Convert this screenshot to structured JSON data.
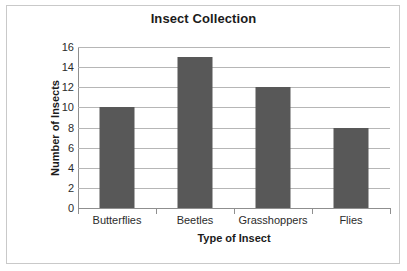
{
  "chart_data": {
    "type": "bar",
    "title": "Insect Collection",
    "xlabel": "Type of Insect",
    "ylabel": "Number of Insects",
    "categories": [
      "Butterflies",
      "Beetles",
      "Grasshoppers",
      "Flies"
    ],
    "values": [
      10,
      15,
      12,
      8
    ],
    "ylim": [
      0,
      16
    ],
    "ytick_step": 2,
    "yticks": [
      0,
      2,
      4,
      6,
      8,
      10,
      12,
      14,
      16
    ],
    "ytick_labels": [
      "0",
      "2",
      "4",
      "6",
      "8",
      "10",
      "12",
      "14",
      "16"
    ],
    "grid": true,
    "legend": false,
    "series": [
      {
        "name": "Number of Insects",
        "values": [
          10,
          15,
          12,
          8
        ]
      }
    ],
    "colors": {
      "bar_fill": "#585858",
      "gridline": "#b6b6b6",
      "axis_line": "#8f8f8f",
      "title_text": "#1b1b1b",
      "tick_text": "#2b2b2b",
      "frame_border": "#c9c9c9",
      "background": "#ffffff"
    }
  }
}
